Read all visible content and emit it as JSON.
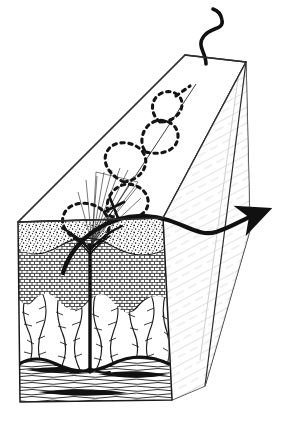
{
  "figure": {
    "title": "Skin block diagram with helical penetration path",
    "type": "pen-and-ink scientific illustration",
    "background_color": "#ffffff",
    "ink_color": "#1a1a1a",
    "width": 286,
    "height": 431
  },
  "block": {
    "name": "skin-block",
    "description": "three-dimensional wedge-shaped block of tissue drawn in perspective",
    "top_face": {
      "label": "skin-surface",
      "fill": "#ffffff",
      "stroke": "#2b2b2b",
      "points": "18,222 185,55 246,62 163,218"
    },
    "front_face": {
      "label": "cut-cross-section",
      "fill": "#ffffff",
      "stroke": "#1a1a1a",
      "points": "18,222 163,218 172,400 20,402"
    },
    "right_face": {
      "label": "right-side-face",
      "fill": "#ffffff",
      "stroke": "#2b2b2b",
      "hatching": "light diagonal",
      "points": "163,218 246,62 250,230 205,386 172,400"
    }
  },
  "layers": [
    {
      "id": "stratum-corneum",
      "label": "stippled surface layer",
      "texture": "stipple",
      "top": 222,
      "bottom": 246
    },
    {
      "id": "epidermis",
      "label": "brick-like cellular layer",
      "texture": "brick-cells",
      "top": 246,
      "bottom": 300
    },
    {
      "id": "dermis",
      "label": "wavy fibrous collagen layer",
      "texture": "wavy-fibers",
      "top": 300,
      "bottom": 362
    },
    {
      "id": "hypodermis",
      "label": "horizontal banded fascia layer",
      "texture": "horizontal-bands",
      "top": 362,
      "bottom": 401
    }
  ],
  "features": [
    {
      "id": "hair-follicle",
      "label": "central vertical follicle shaft",
      "stroke_width": 3
    },
    {
      "id": "dashed-helix",
      "label": "dashed helical penetration path",
      "style": "dashed",
      "turns": 4
    },
    {
      "id": "axis-line",
      "label": "thin diagonal axis of helix",
      "style": "solid-thin"
    },
    {
      "id": "surface-arrow",
      "label": "thick S-curve arrow exiting to the right",
      "arrowhead": true
    },
    {
      "id": "top-squiggle",
      "label": "thick S-curve squiggle on top surface",
      "arrowhead": false
    },
    {
      "id": "fan-lines",
      "label": "converging fan of fine lines at entry point"
    },
    {
      "id": "dark-inclusions",
      "label": "dark lens-shaped inclusions in banded layer",
      "count": 3
    }
  ]
}
